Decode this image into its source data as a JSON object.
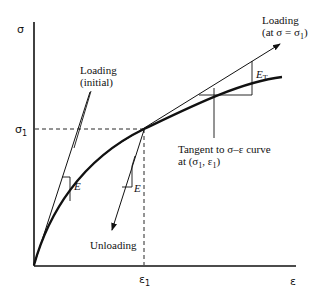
{
  "diagram": {
    "type": "stress-strain curve",
    "axes": {
      "y_label": "σ",
      "x_label": "ε",
      "y_tick": "σ",
      "y_tick_sub": "1",
      "x_tick": "ε",
      "x_tick_sub": "1"
    },
    "labels": {
      "loading_initial_line1": "Loading",
      "loading_initial_line2": "(initial)",
      "loading_at_line1": "Loading",
      "loading_at_line2": "(at σ = σ",
      "loading_at_sub": "1",
      "loading_at_close": ")",
      "tangent_line1": "Tangent to σ–ε curve",
      "tangent_line2_a": "at (σ",
      "tangent_line2_sub1": "1",
      "tangent_line2_b": ", ε",
      "tangent_line2_sub2": "1",
      "tangent_line2_c": ")",
      "unloading": "Unloading",
      "modulus_initial": "E",
      "modulus_unloading": "E",
      "modulus_tangent": "E",
      "modulus_tangent_sub": "T"
    }
  }
}
